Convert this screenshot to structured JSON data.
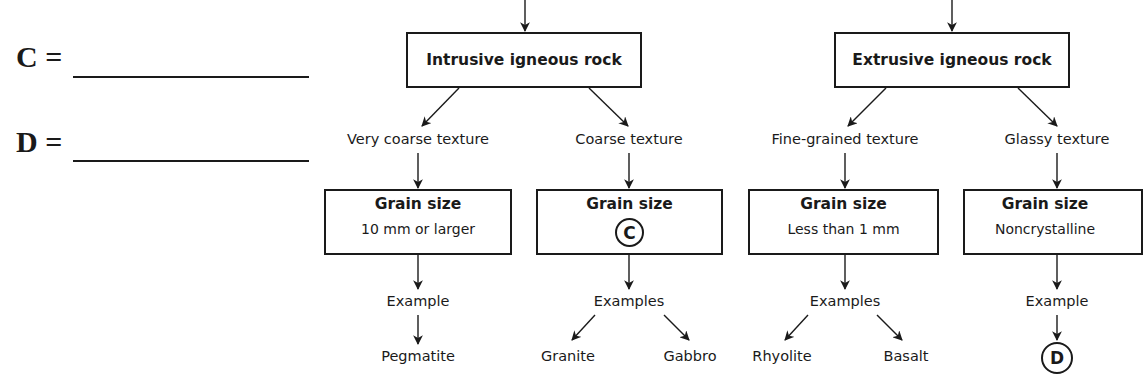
{
  "answers": [
    {
      "letter": "C",
      "label": "C =",
      "value": ""
    },
    {
      "letter": "D",
      "label": "D =",
      "value": ""
    }
  ],
  "branches": [
    {
      "title": "Intrusive igneous rock",
      "children": [
        {
          "texture": "Very coarse texture",
          "grain_title": "Grain size",
          "grain_value": "10 mm or larger",
          "examples_label": "Example",
          "examples": [
            "Pegmatite"
          ]
        },
        {
          "texture": "Coarse texture",
          "grain_title": "Grain size",
          "grain_value": "C",
          "grain_value_is_blank": true,
          "examples_label": "Examples",
          "examples": [
            "Granite",
            "Gabbro"
          ]
        }
      ]
    },
    {
      "title": "Extrusive igneous rock",
      "children": [
        {
          "texture": "Fine-grained texture",
          "grain_title": "Grain size",
          "grain_value": "Less than 1 mm",
          "examples_label": "Examples",
          "examples": [
            "Rhyolite",
            "Basalt"
          ]
        },
        {
          "texture": "Glassy texture",
          "grain_title": "Grain size",
          "grain_value": "Noncrystalline",
          "examples_label": "Example",
          "examples": [
            "D"
          ],
          "example_is_blank": true
        }
      ]
    }
  ]
}
